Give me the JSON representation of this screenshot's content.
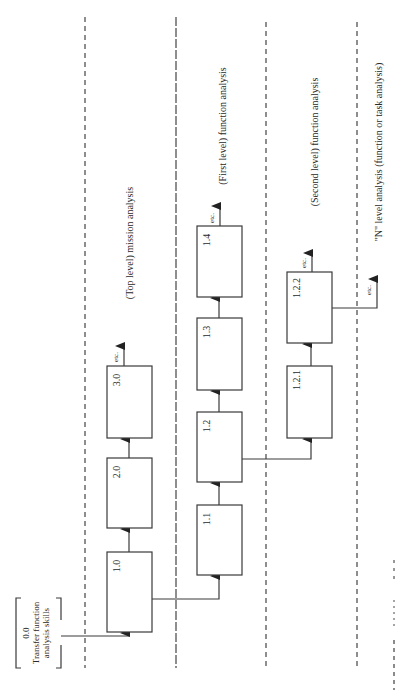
{
  "diagram": {
    "orientation": "rotated-90-ccw",
    "levels": [
      {
        "id": "top",
        "label": "(Top level) mission analysis"
      },
      {
        "id": "first",
        "label": "(First level) function analysis"
      },
      {
        "id": "second",
        "label": "(Second level) function analysis"
      },
      {
        "id": "n",
        "label": "\"N\" level analysis (function or task analysis)"
      }
    ],
    "origin_box": {
      "id": "0.0",
      "line1": "0.0",
      "line2": "Transfer function",
      "line3": "analysis skills"
    },
    "boxes": {
      "b1_0": "1.0",
      "b2_0": "2.0",
      "b3_0": "3.0",
      "b1_1": "1.1",
      "b1_2": "1.2",
      "b1_3": "1.3",
      "b1_4": "1.4",
      "b1_2_1": "1.2.1",
      "b1_2_2": "1.2.2"
    },
    "continuation_label": "etc."
  }
}
